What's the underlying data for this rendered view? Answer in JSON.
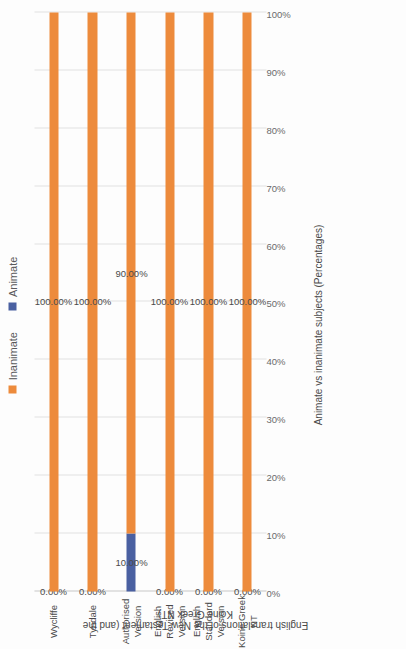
{
  "chart_data": {
    "type": "bar",
    "orientation": "horizontal-stacked",
    "title": "",
    "xlabel": "English translations of the New Testament (and the Koine Greek NT)",
    "ylabel": "Animate vs inanimate subjects (Percentages)",
    "categories": [
      "Wycliffe",
      "Tyndale",
      "Authorised Version",
      "English Revised Version",
      "English Standard Version",
      "Koine Greek NT"
    ],
    "series": [
      {
        "name": "Animate",
        "color": "#4a60a1",
        "values": [
          0,
          0,
          10,
          0,
          0,
          0
        ],
        "labels": [
          "0.00%",
          "0.00%",
          "10.00%",
          "0.00%",
          "0.00%",
          "0.00%"
        ]
      },
      {
        "name": "Inanimate",
        "color": "#ed8b3c",
        "values": [
          100,
          100,
          90,
          100,
          100,
          100
        ],
        "labels": [
          "100.00%",
          "100.00%",
          "90.00%",
          "100.00%",
          "100.00%",
          "100.00%"
        ]
      }
    ],
    "ylim": [
      0,
      100
    ],
    "tick_labels": [
      "0%",
      "10%",
      "20%",
      "30%",
      "40%",
      "50%",
      "60%",
      "70%",
      "80%",
      "90%",
      "100%"
    ],
    "grid": true,
    "legend_position": "top",
    "legend": [
      {
        "label": "Inanimate",
        "color": "#ed8b3c"
      },
      {
        "label": "Animate",
        "color": "#4a60a1"
      }
    ]
  }
}
